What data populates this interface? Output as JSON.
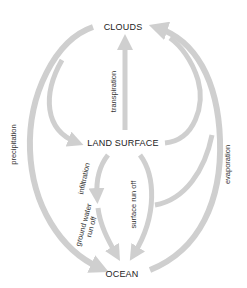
{
  "diagram": {
    "title": "",
    "colors": {
      "arrow": "#cfcfcf",
      "text": "#222222",
      "background": "#ffffff"
    },
    "nodes": {
      "clouds": "CLOUDS",
      "land_surface": "LAND SURFACE",
      "ocean": "OCEAN"
    },
    "flows": {
      "precipitation": "precipitation",
      "transpiration": "transpiration",
      "evaporation": "evaporation",
      "infiltration": "infiltration",
      "ground_water_line1": "ground water",
      "ground_water_line2": "run off",
      "surface_run_off": "surface run off"
    },
    "edges": [
      {
        "from": "clouds",
        "to": "ocean",
        "label": "precipitation"
      },
      {
        "from": "clouds",
        "to": "land_surface",
        "label": "precipitation"
      },
      {
        "from": "land_surface",
        "to": "clouds",
        "label": "transpiration"
      },
      {
        "from": "land_surface",
        "to": "clouds",
        "label": "evaporation"
      },
      {
        "from": "ocean",
        "to": "clouds",
        "label": "evaporation"
      },
      {
        "from": "land_surface",
        "to": "ground",
        "label": "infiltration"
      },
      {
        "from": "ground",
        "to": "ocean",
        "label": "ground water run off"
      },
      {
        "from": "land_surface",
        "to": "ocean",
        "label": "surface run off"
      }
    ]
  }
}
